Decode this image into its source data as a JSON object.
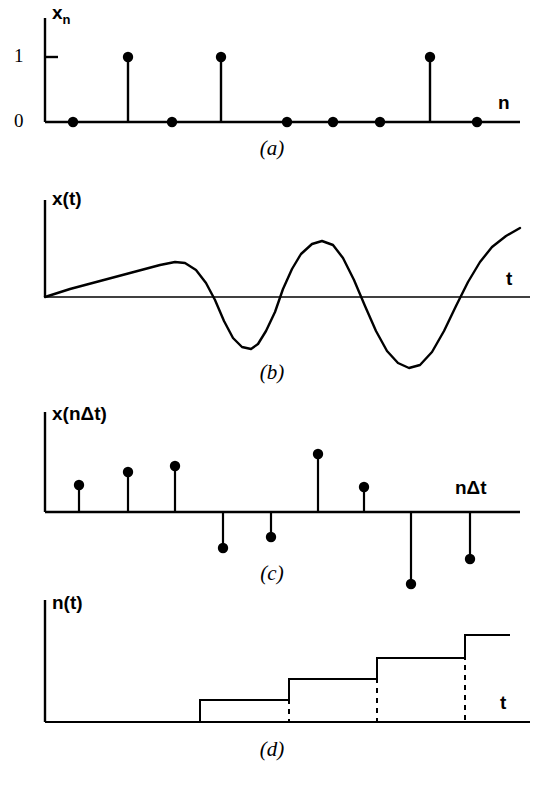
{
  "figure": {
    "panels": [
      {
        "id": "a",
        "caption": "(a)",
        "ylabel": "x",
        "ylabel_sub": "n",
        "xlabel": "n",
        "ytick_labels": [
          "1",
          "0"
        ],
        "description": "binary digital sequence stem plot"
      },
      {
        "id": "b",
        "caption": "(b)",
        "ylabel": "x(t)",
        "xlabel": "t",
        "description": "continuous analog waveform"
      },
      {
        "id": "c",
        "caption": "(c)",
        "ylabel": "x(nΔt)",
        "xlabel": "nΔt",
        "description": "sampled discrete-time signal stem plot"
      },
      {
        "id": "d",
        "caption": "(d)",
        "ylabel": "n(t)",
        "xlabel": "t",
        "description": "monotonic staircase counting function"
      }
    ]
  },
  "chart_data": [
    {
      "type": "bar",
      "panel": "a",
      "title": "(a)",
      "xlabel": "n",
      "ylabel": "x_n",
      "ylim": [
        0,
        1.25
      ],
      "yticks": [
        0,
        1
      ],
      "ytick_labels": [
        "0",
        "1"
      ],
      "grid": false,
      "x": [
        1,
        2,
        3,
        4,
        5,
        6,
        7,
        8,
        9
      ],
      "values": [
        0,
        1,
        0,
        1,
        0,
        0,
        0,
        1,
        0
      ],
      "x_px": [
        73,
        128,
        172,
        221,
        287,
        333,
        380,
        430,
        477
      ],
      "axis_px": {
        "x0": 45,
        "x1": 520,
        "baseline_y": 122,
        "top_y": 18,
        "unit_y": 57
      }
    },
    {
      "type": "line",
      "panel": "b",
      "title": "(b)",
      "xlabel": "t",
      "ylabel": "x(t)",
      "grid": false,
      "zero_line": true,
      "points_px": [
        [
          45,
          297
        ],
        [
          70,
          289
        ],
        [
          100,
          281
        ],
        [
          130,
          273
        ],
        [
          160,
          265
        ],
        [
          175,
          262
        ],
        [
          185,
          263
        ],
        [
          196,
          270
        ],
        [
          206,
          283
        ],
        [
          215,
          300
        ],
        [
          224,
          321
        ],
        [
          233,
          338
        ],
        [
          242,
          347
        ],
        [
          251,
          349
        ],
        [
          258,
          344
        ],
        [
          266,
          331
        ],
        [
          275,
          312
        ],
        [
          283,
          289
        ],
        [
          292,
          269
        ],
        [
          301,
          254
        ],
        [
          312,
          244
        ],
        [
          322,
          241
        ],
        [
          333,
          245
        ],
        [
          343,
          258
        ],
        [
          354,
          280
        ],
        [
          365,
          306
        ],
        [
          376,
          331
        ],
        [
          387,
          351
        ],
        [
          398,
          363
        ],
        [
          409,
          368
        ],
        [
          420,
          365
        ],
        [
          432,
          352
        ],
        [
          444,
          331
        ],
        [
          456,
          306
        ],
        [
          468,
          282
        ],
        [
          480,
          262
        ],
        [
          492,
          247
        ],
        [
          506,
          236
        ],
        [
          520,
          228
        ]
      ],
      "axis_px": {
        "x0": 45,
        "x1": 530,
        "baseline_y": 297,
        "top_y": 200
      },
      "description": "ramp rising from origin then damped oscillation: peak near t=175, trough near t=252, peak near t=322, trough near t=409, rising at right edge"
    },
    {
      "type": "bar",
      "panel": "c",
      "title": "(c)",
      "xlabel": "nΔt",
      "ylabel": "x(nΔt)",
      "grid": false,
      "x": [
        1,
        2,
        3,
        4,
        5,
        6,
        7,
        8,
        9
      ],
      "values": [
        27,
        40,
        46,
        -36,
        -25,
        58,
        25,
        -72,
        -47
      ],
      "x_px": [
        79,
        128,
        175,
        223,
        271,
        318,
        364,
        411,
        470
      ],
      "axis_px": {
        "x0": 45,
        "x1": 520,
        "baseline_y": 512,
        "top_y": 412
      }
    },
    {
      "type": "line",
      "panel": "d",
      "title": "(d)",
      "xlabel": "t",
      "ylabel": "n(t)",
      "grid": false,
      "step_edges_px": [
        200,
        289,
        377,
        465
      ],
      "step_levels_px": [
        700,
        679,
        658,
        635
      ],
      "step_values": [
        1,
        2,
        3,
        4
      ],
      "axis_px": {
        "x0": 45,
        "x1": 530,
        "baseline_y": 722,
        "top_y": 600,
        "right_end": 510
      },
      "description": "staircase: flat at zero until t=200, then four ascending steps with dashed vertical drop lines at each step edge"
    }
  ]
}
